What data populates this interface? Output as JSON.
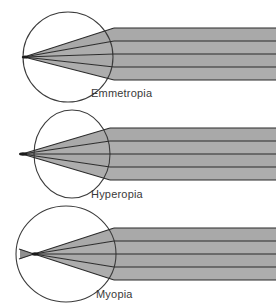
{
  "figure": {
    "background_color": "#ffffff",
    "beam_fill_color": "#a9a9a9",
    "ray_line_color": "#2b2b2b",
    "eye_outline_color": "#3c3c3c",
    "label_color": "#3a3a3a",
    "width": 276,
    "height": 306
  },
  "panels": [
    {
      "id": "emmetropia",
      "label": "Emmetropia",
      "focus_location": "on-retina",
      "eye_shape": "round",
      "ray_count": 5,
      "beam_band_count": 4,
      "eye": {
        "cx": 68,
        "cy": 57,
        "rx": 45,
        "ry": 45
      },
      "focal_point": {
        "x": 24,
        "y": 57
      },
      "cornea_x": 114,
      "beam": {
        "left": 114,
        "right": 276,
        "top": 28,
        "bottom": 80
      },
      "ray_y_positions": [
        28,
        41,
        54,
        67,
        80
      ]
    },
    {
      "id": "hyperopia",
      "label": "Hyperopia",
      "focus_location": "behind-retina",
      "eye_shape": "short-axial",
      "ray_count": 5,
      "beam_band_count": 4,
      "eye": {
        "cx": 72,
        "cy": 48,
        "rx": 38,
        "ry": 44
      },
      "focal_point": {
        "x": 22,
        "y": 48
      },
      "cornea_x": 110,
      "beam": {
        "left": 110,
        "right": 276,
        "top": 22,
        "bottom": 74
      },
      "ray_y_positions": [
        22,
        35,
        48,
        61,
        74
      ]
    },
    {
      "id": "myopia",
      "label": "Myopia",
      "focus_location": "in-front-of-retina",
      "eye_shape": "long-axial",
      "ray_count": 5,
      "beam_band_count": 4,
      "eye": {
        "cx": 66,
        "cy": 50,
        "rx": 50,
        "ry": 48
      },
      "focal_point": {
        "x": 34,
        "y": 50
      },
      "cornea_x": 114,
      "beam": {
        "left": 114,
        "right": 276,
        "top": 24,
        "bottom": 76
      },
      "ray_y_positions": [
        24,
        37,
        50,
        63,
        76
      ]
    }
  ]
}
